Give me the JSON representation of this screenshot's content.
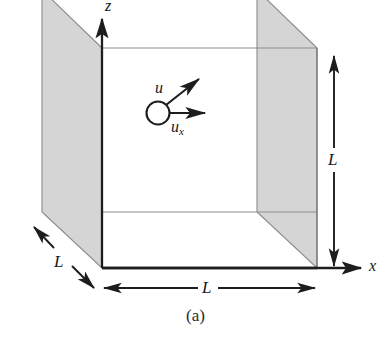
{
  "figure": {
    "caption": "(a)",
    "type": "3d-cube-diagram",
    "colors": {
      "panel_fill": "#d5d5d5",
      "panel_stroke": "#7d7d7d",
      "line": "#1d1d20",
      "thin_line": "#8a8a8a",
      "background": "#ffffff",
      "text": "#16161a"
    },
    "axes": [
      {
        "name": "z-axis",
        "label": "z"
      },
      {
        "name": "x-axis",
        "label": "x"
      }
    ],
    "vectors": [
      {
        "name": "velocity-vector",
        "label": "u",
        "label_sub": ""
      },
      {
        "name": "velocity-x-component-vector",
        "label": "u",
        "label_sub": "x"
      }
    ],
    "dimensions": [
      {
        "name": "height-dimension",
        "label": "L"
      },
      {
        "name": "width-dimension",
        "label": "L"
      },
      {
        "name": "depth-dimension",
        "label": "L"
      }
    ],
    "particle": {
      "name": "gas-molecule",
      "shape": "circle"
    }
  }
}
